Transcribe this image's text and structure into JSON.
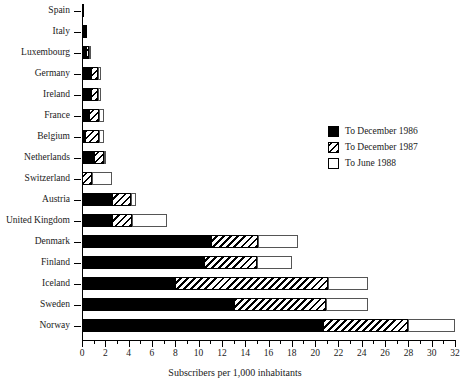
{
  "chart_data": {
    "type": "bar",
    "orientation": "horizontal",
    "stacked": true,
    "title": "",
    "xlabel": "Subscribers per 1,000 inhabitants",
    "ylabel": "",
    "xlim": [
      0,
      32
    ],
    "xticks": [
      0,
      2,
      4,
      6,
      8,
      10,
      12,
      14,
      16,
      18,
      20,
      22,
      24,
      26,
      28,
      30,
      32
    ],
    "xtick_labels": [
      "0",
      "2",
      "4",
      "6",
      "8",
      "10",
      "12",
      "14",
      "16",
      "18",
      "20",
      "22",
      "24",
      "26",
      "28",
      "30",
      "32"
    ],
    "minor_tick_step": 1,
    "grid": false,
    "legend_position": "upper right",
    "categories": [
      "Spain",
      "Italy",
      "Luxembourg",
      "Germany",
      "Ireland",
      "France",
      "Belgium",
      "Netherlands",
      "Switzerland",
      "Austria",
      "United Kingdom",
      "Denmark",
      "Finland",
      "Iceland",
      "Sweden",
      "Norway"
    ],
    "series": [
      {
        "name": "To December 1986",
        "fill": "solid-black",
        "color": "#000000",
        "values": [
          0.15,
          0.3,
          0.35,
          0.75,
          0.75,
          0.6,
          0.25,
          1.0,
          0.0,
          2.6,
          2.6,
          11.1,
          10.5,
          8.0,
          13.0,
          20.7
        ]
      },
      {
        "name": "To December 1987",
        "fill": "hatched",
        "color": "#000000",
        "values": [
          0.0,
          0.15,
          0.25,
          0.65,
          0.65,
          0.9,
          1.25,
          0.9,
          0.9,
          1.6,
          1.7,
          4.0,
          4.5,
          13.1,
          7.9,
          7.3
        ]
      },
      {
        "name": "To June 1988",
        "fill": "white",
        "color": "#ffffff",
        "values": [
          0.0,
          0.0,
          0.2,
          0.25,
          0.25,
          0.4,
          0.35,
          0.2,
          1.7,
          0.4,
          3.0,
          3.4,
          3.0,
          3.4,
          3.6,
          4.0
        ]
      }
    ],
    "cumulative_totals": [
      0.15,
      0.45,
      0.8,
      1.65,
      1.65,
      1.9,
      1.85,
      2.1,
      2.6,
      4.6,
      7.3,
      18.5,
      18.0,
      24.5,
      24.5,
      32.0
    ]
  },
  "legend": {
    "items": [
      {
        "label": "To December 1986",
        "swatch": "solid-black-swatch"
      },
      {
        "label": "To December 1987",
        "swatch": "hatched-swatch"
      },
      {
        "label": "To June 1988",
        "swatch": "white-swatch"
      }
    ]
  }
}
